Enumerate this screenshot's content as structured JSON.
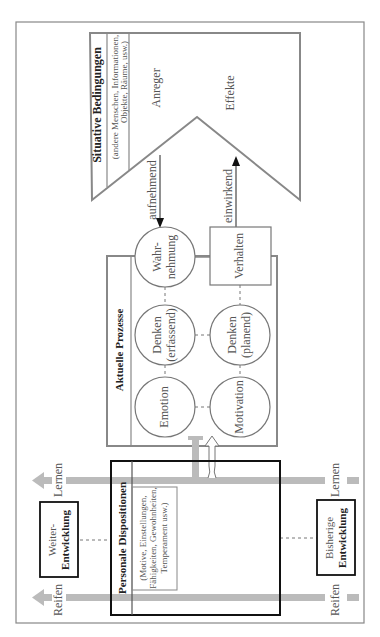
{
  "situative": {
    "title": "Situative Bedingungen",
    "subtitle_line1": "(andere Menschen, Informationen,",
    "subtitle_line2": "Objekte, Räume, usw.)",
    "label_top": "Anreger",
    "label_bottom": "Effekte"
  },
  "arrows": {
    "incoming": "aufnehmend",
    "outgoing": "einwirkend"
  },
  "aktuelle": {
    "title": "Aktuelle Prozesse",
    "nodes": {
      "wahrnehmung_1": "Wahr-",
      "wahrnehmung_2": "nehmung",
      "denken_erfassend_1": "Denken",
      "denken_erfassend_2": "(erfassend)",
      "emotion": "Emotion",
      "denken_planend_1": "Denken",
      "denken_planend_2": "(planend)",
      "motivation": "Motivation",
      "verhalten": "Verhalten"
    }
  },
  "personale": {
    "title": "Personale Dispositionen",
    "sub_line1": "(Motive, Einstellungen,",
    "sub_line2": "Fähigkeiten, Gewohnheiten,",
    "sub_line3": "Temperament usw.)"
  },
  "development": {
    "future_line1": "Weiter-",
    "future_line2": "Entwicklung",
    "past_line1": "Bisherige",
    "past_line2": "Entwicklung",
    "lernen_left": "Lernen",
    "lernen_right": "Lernen",
    "reifen_left": "Reifen",
    "reifen_right": "Reifen"
  },
  "colors": {
    "line": "#777777",
    "band": "#bbbbbb",
    "heavy": "#111111"
  }
}
